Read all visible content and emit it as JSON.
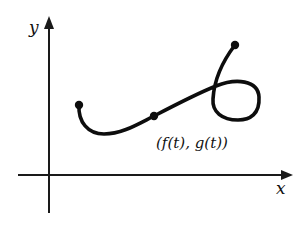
{
  "figure": {
    "axes": {
      "x_label": "x",
      "y_label": "y"
    },
    "curve": {
      "point_label": "(f(t), g(t))",
      "marked_points": [
        {
          "role": "start",
          "x": 79,
          "y": 105
        },
        {
          "role": "current",
          "x": 154,
          "y": 116
        },
        {
          "role": "end",
          "x": 235,
          "y": 45
        }
      ]
    },
    "colors": {
      "ink": "#0d0d0d",
      "background": "#ffffff"
    }
  }
}
